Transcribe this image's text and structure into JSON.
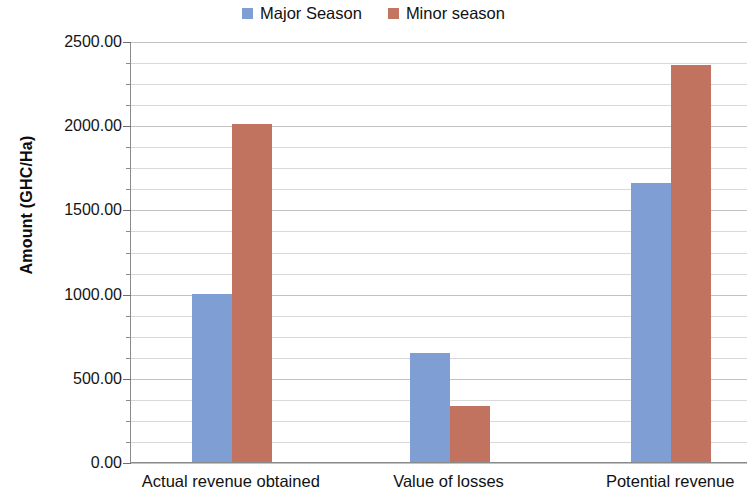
{
  "chart_data": {
    "type": "bar",
    "title": "",
    "subtitle": "",
    "xlabel": "",
    "ylabel": "Amount (GHC/Ha)",
    "categories": [
      "Actual revenue obtained",
      "Value of losses",
      "Potential revenue"
    ],
    "series": [
      {
        "name": "Major Season",
        "color": "#7f9fd4",
        "values": [
          1000,
          645,
          1655
        ]
      },
      {
        "name": "Minor season",
        "color": "#c27360",
        "values": [
          2005,
          333,
          2355
        ]
      }
    ],
    "ylim": [
      0,
      2500
    ],
    "y_major_step": 500,
    "y_minor_step": 125,
    "y_tick_labels": [
      "0.00",
      "500.00",
      "1000.00",
      "1500.00",
      "2000.00",
      "2500.00"
    ],
    "y_tick_values": [
      0,
      500,
      1000,
      1500,
      2000,
      2500
    ],
    "grid": true,
    "grid_axis": "y",
    "legend_position": "top-center",
    "legend_entries": [
      "Major Season",
      "Minor season"
    ],
    "annotations": []
  },
  "axis": {
    "y_title": "Amount (GHC/Ha)"
  }
}
